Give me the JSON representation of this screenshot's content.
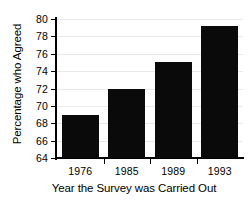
{
  "chart_data": {
    "type": "bar",
    "title": "",
    "xlabel": "Year the Survey was Carried Out",
    "ylabel": "Percentage who Agreed",
    "categories": [
      "1976",
      "1985",
      "1989",
      "1993"
    ],
    "values": [
      69,
      72,
      75,
      79.2
    ],
    "ylim": [
      64,
      80
    ],
    "yticks": [
      64,
      66,
      68,
      70,
      72,
      74,
      76,
      78,
      80
    ],
    "ytick_labels": [
      "64",
      "66",
      "68",
      "70",
      "72",
      "74",
      "76",
      "78",
      "80"
    ],
    "grid": true,
    "legend": null,
    "series": [
      {
        "name": "Percentage who Agreed",
        "values": [
          69,
          72,
          75,
          79.2
        ]
      }
    ],
    "bar_color": "#0a0a0a",
    "background_color": "#ffffff",
    "gridline_color": "#e9e9e9",
    "axis_color": "#000000"
  }
}
